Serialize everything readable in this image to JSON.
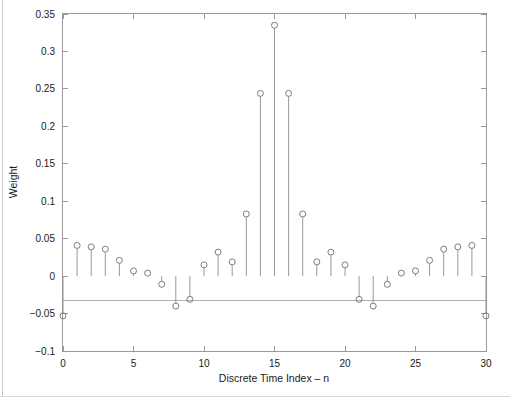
{
  "chart_data": {
    "type": "stem",
    "title": "",
    "xlabel": "Discrete Time Index – n",
    "ylabel": "Weight",
    "xlim": [
      0,
      30
    ],
    "ylim": [
      -0.1,
      0.35
    ],
    "xticks": [
      0,
      5,
      10,
      15,
      20,
      25,
      30
    ],
    "xticklabels": [
      "0",
      "5",
      "10",
      "15",
      "20",
      "25",
      "30"
    ],
    "yticks": [
      -0.1,
      -0.05,
      0,
      0.05,
      0.1,
      0.15,
      0.2,
      0.25,
      0.3,
      0.35
    ],
    "yticklabels": [
      "−0.1",
      "−0.05",
      "0",
      "0.05",
      "0.1",
      "0.15",
      "0.2",
      "0.25",
      "0.3",
      "0.35"
    ],
    "grid": false,
    "legend": null,
    "marker": "open-circle",
    "baseline": 0,
    "x": [
      0,
      1,
      2,
      3,
      4,
      5,
      6,
      7,
      8,
      9,
      10,
      11,
      12,
      13,
      14,
      15,
      16,
      17,
      18,
      19,
      20,
      21,
      22,
      23,
      24,
      25,
      26,
      27,
      28,
      29,
      30
    ],
    "values": [
      -0.053,
      0.041,
      0.039,
      0.036,
      0.021,
      0.007,
      0.004,
      -0.011,
      -0.04,
      -0.031,
      0.015,
      0.032,
      0.019,
      0.083,
      0.244,
      0.335,
      0.244,
      0.083,
      0.019,
      0.032,
      0.015,
      -0.031,
      -0.04,
      -0.011,
      0.004,
      0.007,
      0.021,
      0.036,
      0.039,
      0.041,
      -0.053
    ],
    "series_name": "Weight"
  },
  "axes": {
    "x_axis_name": "Discrete Time Index – n",
    "y_axis_name": "Weight"
  }
}
